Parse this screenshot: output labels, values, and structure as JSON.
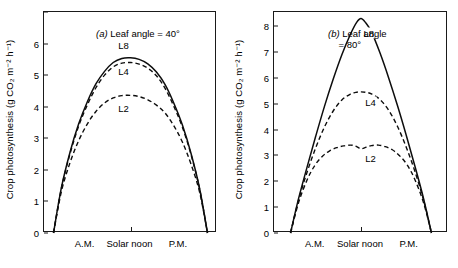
{
  "chart_data": [
    {
      "type": "line",
      "panel": "a",
      "title": "(a) Leaf angle = 40°",
      "title_prefix": "(a)",
      "title_rest": " Leaf angle = 40°",
      "xlabel": "",
      "ylabel": "Crop photosynthesis (g CO₂ m⁻² h⁻¹)",
      "x_categories": [
        "A.M.",
        "Solar noon",
        "P.M."
      ],
      "x_tick_positions": [
        0.5
      ],
      "ylim": [
        0,
        7.0
      ],
      "yticks": [
        0,
        1,
        2,
        3,
        4,
        5,
        6
      ],
      "ytick_labels": [
        "0",
        "1",
        "2",
        "3",
        "4",
        "5",
        "6"
      ],
      "grid": false,
      "legend": "inline-curve-labels",
      "series": [
        {
          "name": "L8",
          "style": "solid",
          "label_x": 0.46,
          "label_y": 5.95,
          "x": [
            0.055,
            0.1,
            0.15,
            0.2,
            0.25,
            0.3,
            0.35,
            0.4,
            0.45,
            0.5,
            0.55,
            0.6,
            0.65,
            0.7,
            0.75,
            0.8,
            0.85,
            0.9,
            0.945
          ],
          "values": [
            0.0,
            1.42,
            2.55,
            3.45,
            4.15,
            4.72,
            5.12,
            5.4,
            5.53,
            5.55,
            5.5,
            5.36,
            5.1,
            4.7,
            4.12,
            3.42,
            2.52,
            1.4,
            0.0
          ]
        },
        {
          "name": "L4",
          "style": "dashed",
          "label_x": 0.46,
          "label_y": 5.12,
          "x": [
            0.055,
            0.1,
            0.15,
            0.2,
            0.25,
            0.3,
            0.35,
            0.4,
            0.45,
            0.5,
            0.55,
            0.6,
            0.65,
            0.7,
            0.75,
            0.8,
            0.85,
            0.9,
            0.945
          ],
          "values": [
            0.0,
            1.4,
            2.5,
            3.38,
            4.05,
            4.6,
            5.0,
            5.26,
            5.38,
            5.4,
            5.35,
            5.22,
            4.98,
            4.58,
            4.02,
            3.35,
            2.48,
            1.38,
            0.0
          ]
        },
        {
          "name": "L2",
          "style": "dashed",
          "label_x": 0.46,
          "label_y": 3.95,
          "x": [
            0.055,
            0.1,
            0.15,
            0.2,
            0.25,
            0.3,
            0.35,
            0.4,
            0.45,
            0.5,
            0.55,
            0.6,
            0.65,
            0.7,
            0.75,
            0.8,
            0.85,
            0.9,
            0.945
          ],
          "values": [
            0.0,
            1.3,
            2.22,
            2.92,
            3.45,
            3.85,
            4.12,
            4.28,
            4.35,
            4.36,
            4.32,
            4.22,
            4.05,
            3.8,
            3.4,
            2.88,
            2.18,
            1.28,
            0.0
          ]
        }
      ]
    },
    {
      "type": "line",
      "panel": "b",
      "title": "(b) Leaf angle\n= 80°",
      "title_prefix": "(b)",
      "title_rest": " Leaf angle\n    = 80°",
      "xlabel": "",
      "ylabel": "Crop photosynthesis (g CO₂ m⁻² h⁻¹)",
      "x_categories": [
        "A.M.",
        "Solar noon",
        "P.M."
      ],
      "x_tick_positions": [
        0.5
      ],
      "ylim": [
        0,
        8.55
      ],
      "yticks": [
        0,
        1,
        2,
        3,
        4,
        5,
        6,
        7,
        8
      ],
      "ytick_labels": [
        "0",
        "1",
        "2",
        "3",
        "4",
        "5",
        "6",
        "7",
        "8"
      ],
      "grid": false,
      "legend": "inline-curve-labels",
      "series": [
        {
          "name": "L8",
          "style": "solid",
          "label_x": 0.545,
          "label_y": 7.75,
          "x": [
            0.095,
            0.14,
            0.19,
            0.24,
            0.29,
            0.34,
            0.39,
            0.44,
            0.475,
            0.5,
            0.525,
            0.56,
            0.61,
            0.66,
            0.71,
            0.76,
            0.81,
            0.86,
            0.905
          ],
          "values": [
            0.0,
            1.3,
            2.55,
            3.75,
            4.9,
            5.95,
            6.9,
            7.7,
            8.15,
            8.3,
            8.15,
            7.78,
            6.95,
            5.98,
            4.92,
            3.78,
            2.58,
            1.32,
            0.0
          ]
        },
        {
          "name": "L4",
          "style": "dashed",
          "label_x": 0.555,
          "label_y": 5.08,
          "x": [
            0.095,
            0.14,
            0.19,
            0.24,
            0.29,
            0.34,
            0.39,
            0.44,
            0.47,
            0.5,
            0.53,
            0.56,
            0.61,
            0.66,
            0.71,
            0.76,
            0.81,
            0.86,
            0.905
          ],
          "values": [
            0.0,
            1.25,
            2.35,
            3.3,
            4.1,
            4.72,
            5.15,
            5.38,
            5.44,
            5.46,
            5.44,
            5.38,
            5.16,
            4.74,
            4.12,
            3.32,
            2.38,
            1.26,
            0.0
          ]
        },
        {
          "name": "L2",
          "style": "dashed",
          "label_x": 0.555,
          "label_y": 2.92,
          "x": [
            0.095,
            0.14,
            0.19,
            0.235,
            0.28,
            0.32,
            0.36,
            0.4,
            0.44,
            0.47,
            0.5,
            0.53,
            0.56,
            0.6,
            0.64,
            0.68,
            0.72,
            0.765,
            0.81,
            0.86,
            0.905
          ],
          "values": [
            0.0,
            1.15,
            2.05,
            2.62,
            2.98,
            3.18,
            3.3,
            3.37,
            3.4,
            3.36,
            3.26,
            3.32,
            3.38,
            3.4,
            3.34,
            3.22,
            3.0,
            2.64,
            2.06,
            1.16,
            0.0
          ]
        }
      ]
    }
  ],
  "figure": {
    "ylabel": "Crop photosynthesis (g CO₂ m⁻² h⁻¹)",
    "x_categories": [
      "A.M.",
      "Solar noon",
      "P.M."
    ]
  }
}
